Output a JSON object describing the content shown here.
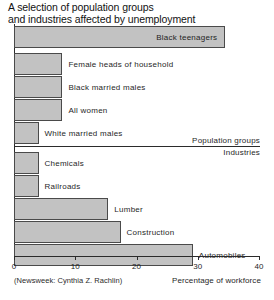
{
  "chart_data": {
    "type": "bar",
    "orientation": "horizontal",
    "title": "A selection of population groups and industries affected by unemployment",
    "title_lines": [
      "A selection of population groups",
      "and industries affected by unemployment"
    ],
    "xlabel": "Percentage of workforce",
    "ylabel": "",
    "xlim": [
      0,
      40
    ],
    "xticks": [
      0,
      10,
      20,
      30,
      40
    ],
    "xtick_labels": [
      "0",
      "10",
      "20",
      "30",
      "40"
    ],
    "grid": false,
    "legend": false,
    "source": "(Newsweek: Cynthia Z. Rachlin)",
    "section_labels": {
      "upper": "Population groups",
      "lower": "Industries"
    },
    "categories": [
      "Black teenagers",
      "Female heads of household",
      "Black married males",
      "All women",
      "White married males",
      "Chemicals",
      "Railroads",
      "Lumber",
      "Construction",
      "Automobiles"
    ],
    "values": [
      34.5,
      7.9,
      7.9,
      7.9,
      4.0,
      4.0,
      4.0,
      15.4,
      17.4,
      29.2
    ],
    "bars": [
      {
        "label": "Black teenagers",
        "value": 34.5,
        "section": "Population groups",
        "label_position": "inside"
      },
      {
        "label": "Female heads of household",
        "value": 7.9,
        "section": "Population groups",
        "label_position": "outside"
      },
      {
        "label": "Black married males",
        "value": 7.9,
        "section": "Population groups",
        "label_position": "outside"
      },
      {
        "label": "All women",
        "value": 7.9,
        "section": "Population groups",
        "label_position": "outside"
      },
      {
        "label": "White married males",
        "value": 4.0,
        "section": "Population groups",
        "label_position": "outside"
      },
      {
        "label": "Chemicals",
        "value": 4.0,
        "section": "Industries",
        "label_position": "outside"
      },
      {
        "label": "Railroads",
        "value": 4.0,
        "section": "Industries",
        "label_position": "outside"
      },
      {
        "label": "Lumber",
        "value": 15.4,
        "section": "Industries",
        "label_position": "outside"
      },
      {
        "label": "Construction",
        "value": 17.4,
        "section": "Industries",
        "label_position": "outside"
      },
      {
        "label": "Automobiles",
        "value": 29.2,
        "section": "Industries",
        "label_position": "outside"
      }
    ],
    "colors": {
      "bar_fill": "#c2c2c2",
      "bar_stroke": "#4a4a4a",
      "axis": "#2b2b2b",
      "text": "#1f1f1f",
      "background": "#ffffff"
    }
  }
}
